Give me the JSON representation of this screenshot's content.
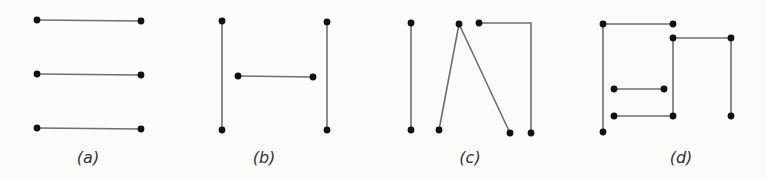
{
  "figure": {
    "panels": [
      {
        "id": "a",
        "label": "(a)",
        "description": "three disjoint horizontal segments"
      },
      {
        "id": "b",
        "label": "(b)",
        "description": "two vertical segments with a shorter horizontal segment between them"
      },
      {
        "id": "c",
        "label": "(c)",
        "description": "vertical segment, inverted V path, and a path going right then down"
      },
      {
        "id": "d",
        "label": "(d)",
        "description": "nested L/U shaped paths with two short horizontal segments"
      }
    ],
    "colors": {
      "edge": "#6f6f6f",
      "node": "#111111",
      "background": "#fbfbfa"
    }
  }
}
